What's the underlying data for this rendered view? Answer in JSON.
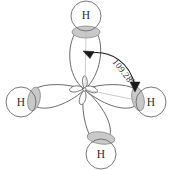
{
  "figure": {
    "molecule": "CH4",
    "background_color": "#ffffff",
    "stroke_color": "#5a5a5a",
    "lobe_fill": "#ffffff",
    "overlap_fill": "#c9c9c9",
    "overlap_stroke": "#8a8a8a",
    "text_color": "#2b2b2b",
    "arrow_color": "#1a1a1a"
  },
  "atoms": [
    {
      "id": "top",
      "label": "H",
      "cx": 86,
      "cy": 16,
      "r": 15
    },
    {
      "id": "left",
      "label": "H",
      "cx": 21,
      "cy": 102,
      "r": 15
    },
    {
      "id": "right",
      "label": "H",
      "cx": 151,
      "cy": 102,
      "r": 15
    },
    {
      "id": "bottom",
      "label": "H",
      "cx": 101,
      "cy": 154,
      "r": 15
    }
  ],
  "overlaps": [
    {
      "id": "top",
      "cx": 86,
      "cy": 32,
      "rx": 14,
      "ry": 6,
      "rotate": 0
    },
    {
      "id": "left",
      "cx": 34,
      "cy": 99,
      "rx": 6,
      "ry": 12,
      "rotate": 12
    },
    {
      "id": "right",
      "cx": 138,
      "cy": 99,
      "rx": 6,
      "ry": 12,
      "rotate": -12
    },
    {
      "id": "bottom",
      "cx": 101,
      "cy": 138,
      "rx": 14,
      "ry": 6,
      "rotate": 8
    }
  ],
  "nucleus": {
    "cx": 84,
    "cy": 89
  },
  "annotation": {
    "angle_value": "109.28",
    "angle_degree_symbol": "0",
    "angle_text_full": "109.280",
    "rotation_deg": 52,
    "text_x": 112,
    "text_y": 66
  },
  "arrow": {
    "from_target": "top-bond",
    "to_target": "right-bond",
    "head_count": 2
  }
}
